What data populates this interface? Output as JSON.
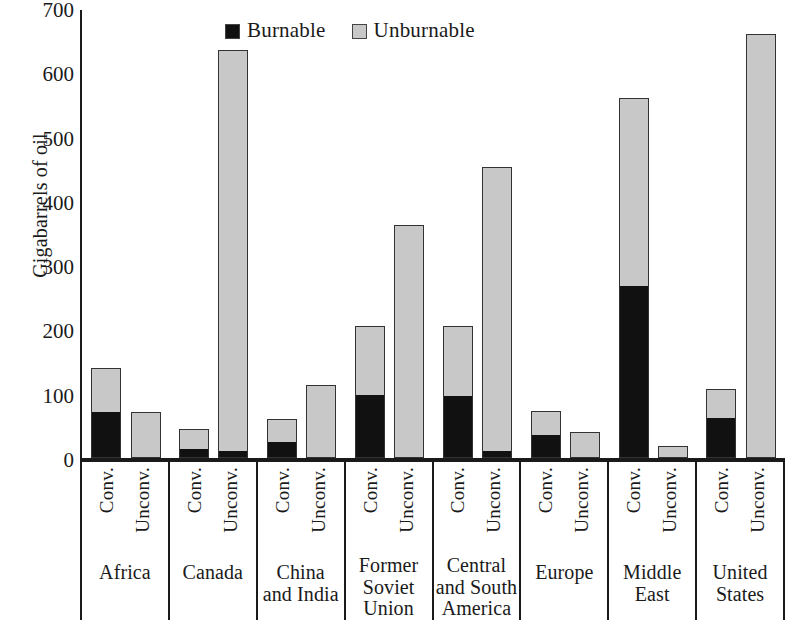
{
  "chart_data": {
    "type": "bar",
    "stacked": true,
    "title": "",
    "xlabel": "",
    "ylabel": "Gigabarrels of oil",
    "ylim": [
      0,
      700
    ],
    "ytick_step": 100,
    "yticks": [
      700,
      600,
      500,
      400,
      300,
      200,
      100,
      0
    ],
    "grid": false,
    "legend_position": "top-center",
    "legend": [
      {
        "name": "Burnable",
        "color": "#111111"
      },
      {
        "name": "Unburnable",
        "color": "#c8c8c8"
      }
    ],
    "subcategories": [
      "Conv.",
      "Unconv."
    ],
    "categories": [
      "Africa",
      "Canada",
      "China and India",
      "Former Soviet Union",
      "Central and South America",
      "Europe",
      "Middle East",
      "United States"
    ],
    "groups": [
      {
        "category": "Africa",
        "bars": [
          {
            "sub": "Conv.",
            "burnable": 71,
            "unburnable": 69,
            "total": 140
          },
          {
            "sub": "Unconv.",
            "burnable": 0,
            "unburnable": 71,
            "total": 71
          }
        ]
      },
      {
        "category": "Canada",
        "bars": [
          {
            "sub": "Conv.",
            "burnable": 13,
            "unburnable": 32,
            "total": 45
          },
          {
            "sub": "Unconv.",
            "burnable": 9,
            "unburnable": 625,
            "total": 634
          }
        ]
      },
      {
        "category": "China and India",
        "bars": [
          {
            "sub": "Conv.",
            "burnable": 25,
            "unburnable": 35,
            "total": 60
          },
          {
            "sub": "Unconv.",
            "burnable": 0,
            "unburnable": 114,
            "total": 114
          }
        ]
      },
      {
        "category": "Former Soviet Union",
        "bars": [
          {
            "sub": "Conv.",
            "burnable": 98,
            "unburnable": 107,
            "total": 205
          },
          {
            "sub": "Unconv.",
            "burnable": 0,
            "unburnable": 363,
            "total": 363
          }
        ]
      },
      {
        "category": "Central and South America",
        "bars": [
          {
            "sub": "Conv.",
            "burnable": 97,
            "unburnable": 108,
            "total": 205
          },
          {
            "sub": "Unconv.",
            "burnable": 10,
            "unburnable": 442,
            "total": 452
          }
        ]
      },
      {
        "category": "Europe",
        "bars": [
          {
            "sub": "Conv.",
            "burnable": 36,
            "unburnable": 37,
            "total": 73
          },
          {
            "sub": "Unconv.",
            "burnable": 0,
            "unburnable": 40,
            "total": 40
          }
        ]
      },
      {
        "category": "Middle East",
        "bars": [
          {
            "sub": "Conv.",
            "burnable": 267,
            "unburnable": 293,
            "total": 560
          },
          {
            "sub": "Unconv.",
            "burnable": 0,
            "unburnable": 19,
            "total": 19
          }
        ]
      },
      {
        "category": "United States",
        "bars": [
          {
            "sub": "Conv.",
            "burnable": 62,
            "unburnable": 46,
            "total": 108
          },
          {
            "sub": "Unconv.",
            "burnable": 0,
            "unburnable": 660,
            "total": 660
          }
        ]
      }
    ]
  }
}
